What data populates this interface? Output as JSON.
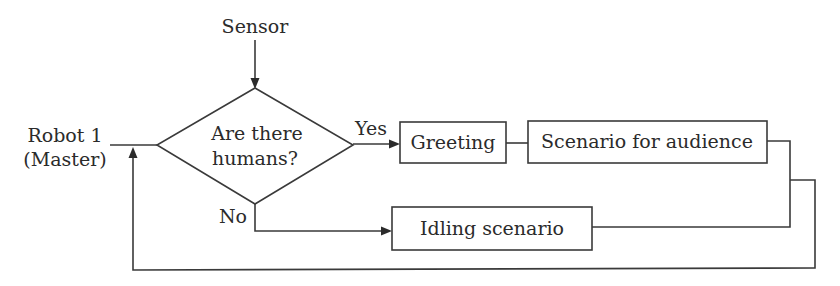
{
  "diagram": {
    "type": "flowchart",
    "nodes": {
      "sensor": {
        "label": "Sensor",
        "kind": "input"
      },
      "robot": {
        "label_line1": "Robot 1",
        "label_line2": "(Master)",
        "kind": "start"
      },
      "decision": {
        "label_line1": "Are there",
        "label_line2": "humans?",
        "kind": "decision"
      },
      "greeting": {
        "label": "Greeting",
        "kind": "process"
      },
      "scenario_audience": {
        "label": "Scenario for audience",
        "kind": "process"
      },
      "idling": {
        "label": "Idling scenario",
        "kind": "process"
      }
    },
    "edge_labels": {
      "yes": "Yes",
      "no": "No"
    },
    "edges": [
      {
        "from": "sensor",
        "to": "decision"
      },
      {
        "from": "robot",
        "to": "decision"
      },
      {
        "from": "decision",
        "to": "greeting",
        "label": "Yes"
      },
      {
        "from": "greeting",
        "to": "scenario_audience"
      },
      {
        "from": "decision",
        "to": "idling",
        "label": "No"
      },
      {
        "from": "scenario_audience",
        "to": "robot",
        "note": "loop back"
      },
      {
        "from": "idling",
        "to": "robot",
        "note": "loop back"
      }
    ],
    "colors": {
      "line": "#3a3a3a",
      "text": "#2b2b2b",
      "background": "#ffffff"
    }
  }
}
